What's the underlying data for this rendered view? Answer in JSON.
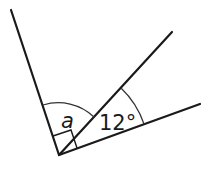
{
  "diagram": {
    "type": "angle-diagram",
    "vertex": [
      59,
      155
    ],
    "rays": [
      {
        "name": "left-ray",
        "end": [
          11,
          10
        ]
      },
      {
        "name": "middle-ray",
        "end": [
          172,
          32
        ]
      },
      {
        "name": "right-ray",
        "end": [
          200,
          104
        ]
      }
    ],
    "labels": {
      "angle_a": "a",
      "angle_given": "12°"
    },
    "right_angle_marker": true,
    "colors": {
      "line": "#1a1a1a",
      "background": "#ffffff"
    }
  }
}
